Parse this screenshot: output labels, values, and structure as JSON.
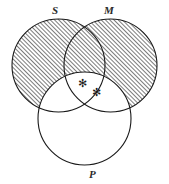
{
  "diagram": {
    "kind": "venn-diagram",
    "sets": [
      {
        "id": "S",
        "label": "S",
        "cx": 58.5,
        "cy": 65.5,
        "r": 46.5,
        "shaded": true,
        "label_x": 52,
        "label_y": 5
      },
      {
        "id": "M",
        "label": "M",
        "cx": 110.5,
        "cy": 65.5,
        "r": 46.5,
        "shaded": true,
        "label_x": 104,
        "label_y": 5
      },
      {
        "id": "P",
        "label": "P",
        "cx": 84.5,
        "cy": 118.5,
        "r": 46.5,
        "shaded": false,
        "label_x": 89,
        "label_y": 169
      }
    ],
    "marks": [
      {
        "id": "star-1",
        "glyph": "✻",
        "x": 78,
        "y": 78
      },
      {
        "id": "star-2",
        "glyph": "✻",
        "x": 92,
        "y": 87
      }
    ],
    "shading": {
      "style": "diagonal-hatch",
      "direction": "bottom-left-to-top-right",
      "spacing_px": 3,
      "line_width_px": 1,
      "color": "#1a1a1a",
      "shaded_description": "S union M minus P",
      "unshaded_description": "P, and all regions of S or M that overlap P"
    },
    "stroke": {
      "color": "#1a1a1a",
      "width_px": 1.1
    },
    "background": "#ffffff",
    "width": 169,
    "height": 184
  }
}
